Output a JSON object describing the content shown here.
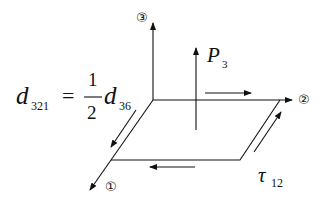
{
  "axes": {
    "axis1_label": "①",
    "axis2_label": "②",
    "axis3_label": "③"
  },
  "field": {
    "symbol": "P",
    "subscript": "3"
  },
  "stress": {
    "symbol": "τ",
    "subscript": "12"
  },
  "equation": {
    "lhs_symbol": "d",
    "lhs_subscript": "321",
    "equals": "=",
    "numerator": "1",
    "denominator": "2",
    "rhs_symbol": "d",
    "rhs_subscript": "36"
  },
  "colors": {
    "stroke": "#111111",
    "background": "#ffffff"
  }
}
